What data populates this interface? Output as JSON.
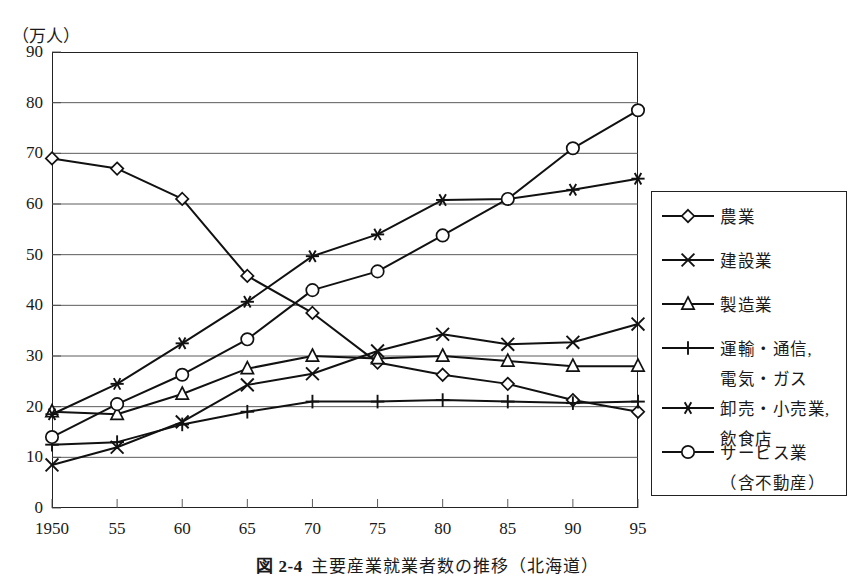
{
  "axis": {
    "unit_label": "（万人）",
    "y_ticks": [
      "90",
      "80",
      "70",
      "60",
      "50",
      "40",
      "30",
      "20",
      "10",
      "0"
    ],
    "x_ticks": [
      "1950",
      "55",
      "60",
      "65",
      "70",
      "75",
      "80",
      "85",
      "90",
      "95"
    ]
  },
  "legend": {
    "items": [
      {
        "name": "農業",
        "marker": "diamond",
        "extra": null
      },
      {
        "name": "建設業",
        "marker": "cross",
        "extra": null
      },
      {
        "name": "製造業",
        "marker": "triangle",
        "extra": null
      },
      {
        "name": "運輸・通信,",
        "marker": "plus",
        "extra": "電気・ガス"
      },
      {
        "name": "卸売・小売業,",
        "marker": "asterisk",
        "extra": "飲食店"
      },
      {
        "name": "サービス業",
        "marker": "circle",
        "extra": "（含不動産）"
      }
    ]
  },
  "caption": {
    "figure_number": "図 2-4",
    "text": "主要産業就業者数の推移（北海道）"
  },
  "chart_data": {
    "type": "line",
    "title": "主要産業就業者数の推移（北海道）",
    "xlabel": "",
    "ylabel": "（万人）",
    "xlim": [
      1950,
      1995
    ],
    "ylim": [
      0,
      90
    ],
    "grid": true,
    "legend_position": "right",
    "x": [
      1950,
      1955,
      1960,
      1965,
      1970,
      1975,
      1980,
      1985,
      1990,
      1995
    ],
    "categories": [
      "1950",
      "55",
      "60",
      "65",
      "70",
      "75",
      "80",
      "85",
      "90",
      "95"
    ],
    "series": [
      {
        "name": "農業",
        "marker": "diamond",
        "values": [
          69.0,
          67.0,
          61.0,
          45.8,
          38.5,
          28.7,
          26.3,
          24.5,
          21.3,
          19.0
        ]
      },
      {
        "name": "建設業",
        "marker": "cross",
        "values": [
          8.5,
          12.0,
          17.0,
          24.3,
          26.5,
          31.0,
          34.3,
          32.3,
          32.7,
          36.3
        ]
      },
      {
        "name": "製造業",
        "marker": "triangle",
        "values": [
          19.0,
          18.5,
          22.5,
          27.5,
          30.0,
          29.5,
          30.0,
          29.0,
          28.0,
          28.0
        ]
      },
      {
        "name": "運輸・通信, 電気・ガス",
        "marker": "plus",
        "values": [
          12.5,
          13.0,
          16.5,
          19.0,
          21.0,
          21.0,
          21.3,
          21.0,
          20.7,
          21.0
        ]
      },
      {
        "name": "卸売・小売業, 飲食店",
        "marker": "asterisk",
        "values": [
          18.5,
          24.5,
          32.5,
          40.7,
          49.7,
          54.0,
          60.8,
          61.0,
          62.8,
          65.0
        ]
      },
      {
        "name": "サービス業（含不動産）",
        "marker": "circle",
        "values": [
          14.0,
          20.5,
          26.3,
          33.3,
          43.0,
          46.7,
          53.8,
          61.0,
          71.0,
          78.5
        ]
      }
    ]
  },
  "colors": {
    "ink": "#111111",
    "grid": "#4a4a4a",
    "background": "#ffffff"
  }
}
